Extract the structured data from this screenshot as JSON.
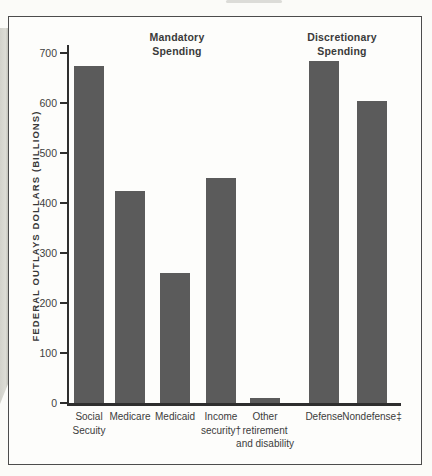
{
  "page": {
    "background": "#fbfbf8",
    "box_border_color": "#4c4c4c"
  },
  "chart_data": {
    "type": "bar",
    "title": "",
    "xlabel": "",
    "ylabel": "FEDERAL OUTLAYS DOLLARS (BILLIONS)",
    "ylim": [
      0,
      700
    ],
    "ytick_step": 100,
    "yticks": [
      0,
      100,
      200,
      300,
      400,
      500,
      600,
      700
    ],
    "grid": false,
    "legend": "none",
    "group_headers": [
      {
        "label": "Mandatory\nSpending",
        "center_x": 168
      },
      {
        "label": "Discretionary\nSpending",
        "center_x": 333
      }
    ],
    "categories": [
      "Social Secuity",
      "Medicare",
      "Medicaid",
      "Income security†",
      "Other retirement and disability",
      "Defense",
      "Nondefense‡"
    ],
    "bars": [
      {
        "label": "Social\nSecuity",
        "value": 675,
        "group": "mandatory",
        "x": 5
      },
      {
        "label": "Medicare",
        "value": 425,
        "group": "mandatory",
        "x": 46
      },
      {
        "label": "Medicaid",
        "value": 260,
        "group": "mandatory",
        "x": 91
      },
      {
        "label": "Income\nsecurity†",
        "value": 450,
        "group": "mandatory",
        "x": 137
      },
      {
        "label": "Other\nretirement\nand disability",
        "value": 10,
        "group": "mandatory",
        "x": 181
      },
      {
        "label": "Defense",
        "value": 685,
        "group": "discretionary",
        "x": 240
      },
      {
        "label": "Nondefense‡",
        "value": 605,
        "group": "discretionary",
        "x": 288
      }
    ],
    "bar_color": "#5b5b5b",
    "axis_color": "#2e2e2e",
    "bar_width": 30,
    "px_per_unit": 0.5
  }
}
